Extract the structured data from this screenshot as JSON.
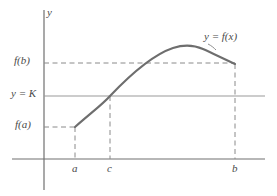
{
  "figure": {
    "caption": "Intermediate Value Theorem diagram",
    "axis_labels": {
      "y_axis": "y",
      "x_tick_a": "a",
      "x_tick_c": "c",
      "x_tick_b": "b"
    },
    "value_labels": {
      "f_of_b": "f(b)",
      "y_equals_k": "y = K",
      "f_of_a": "f(a)"
    },
    "curve_label": "y = f(x)",
    "colors": {
      "curve": "#6e6e6e",
      "axis": "#707070",
      "guide_line": "#9a9a9a",
      "dashed": "#8a8a8a",
      "text": "#4a4a4a",
      "background": "#ffffff"
    }
  },
  "chart_data": {
    "type": "line",
    "title": "",
    "xlabel": "",
    "ylabel": "y",
    "grid": false,
    "legend": "none",
    "xlim": [
      12,
      265
    ],
    "ylim": [
      159,
      10
    ],
    "annotations": [
      {
        "name": "y-axis-label",
        "text": "y",
        "x": 47,
        "y": 14
      },
      {
        "name": "curve-label",
        "text": "y = f(x)",
        "x": 204,
        "y": 36
      },
      {
        "name": "f-of-b-label",
        "text": "f(b)",
        "x": 14,
        "y": 63
      },
      {
        "name": "y-equals-k-label",
        "text": "y = K",
        "x": 11,
        "y": 96
      },
      {
        "name": "f-of-a-label",
        "text": "f(a)",
        "x": 15,
        "y": 127
      },
      {
        "name": "a-tick-label",
        "text": "a",
        "x": 75,
        "y": 168
      },
      {
        "name": "c-tick-label",
        "text": "c",
        "x": 110,
        "y": 168
      },
      {
        "name": "b-tick-label",
        "text": "b",
        "x": 235,
        "y": 168
      }
    ],
    "axes": {
      "y_axis": {
        "x": 44,
        "y_top": 10,
        "y_bottom": 190
      },
      "x_axis": {
        "y": 159,
        "x_left": 12,
        "x_right": 265
      }
    },
    "key_points": [
      {
        "name": "a",
        "label": "(a, f(a))",
        "x": 75,
        "y": 127
      },
      {
        "name": "c",
        "label": "(c, K)",
        "x": 110,
        "y": 96
      },
      {
        "name": "peak",
        "label": "maximum",
        "x": 195,
        "y": 46
      },
      {
        "name": "b",
        "label": "(b, f(b))",
        "x": 235,
        "y": 64
      }
    ],
    "curve_path": "M 75,127 C 92,112 103,104 110,96 C 130,75 152,55 173,48 C 185,44 194,45 203,49 C 214,54 226,60 235,64",
    "horizontal_lines": [
      {
        "name": "y-equals-K-line",
        "style": "solid",
        "y": 96,
        "x_start": 44,
        "x_end": 265
      },
      {
        "name": "f-of-b-dashed",
        "style": "dashed",
        "y": 63,
        "x_start": 44,
        "x_end": 235
      },
      {
        "name": "f-of-a-dashed",
        "style": "dashed",
        "y": 127,
        "x_start": 44,
        "x_end": 75
      }
    ],
    "vertical_lines": [
      {
        "name": "a-dashed",
        "style": "dashed",
        "x": 75,
        "y_start": 127,
        "y_end": 159
      },
      {
        "name": "c-dashed",
        "style": "dashed",
        "x": 110,
        "y_start": 96,
        "y_end": 159
      },
      {
        "name": "b-dashed",
        "style": "dashed",
        "x": 235,
        "y_start": 64,
        "y_end": 159
      }
    ]
  }
}
